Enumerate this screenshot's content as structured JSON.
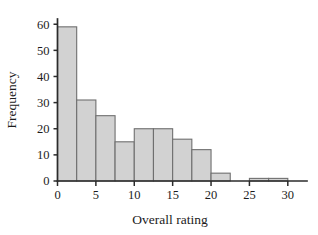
{
  "chart_data": {
    "type": "bar",
    "title": "",
    "xlabel": "Overall rating",
    "ylabel": "Frequency",
    "bin_width": 2.5,
    "bin_edges": [
      0,
      2.5,
      5,
      7.5,
      10,
      12.5,
      15,
      17.5,
      20,
      22.5,
      25,
      27.5,
      30,
      32.5
    ],
    "categories": [
      "0-2.5",
      "2.5-5",
      "5-7.5",
      "7.5-10",
      "10-12.5",
      "12.5-15",
      "15-17.5",
      "17.5-20",
      "20-22.5",
      "22.5-25",
      "25-27.5",
      "27.5-30",
      "30-32.5"
    ],
    "values": [
      59,
      31,
      25,
      15,
      20,
      20,
      16,
      12,
      3,
      0,
      1,
      1,
      0
    ],
    "xlim": [
      0,
      32.5
    ],
    "ylim": [
      0,
      62
    ],
    "xticks": [
      0,
      5,
      10,
      15,
      20,
      25,
      30
    ],
    "xtick_labels": [
      "0",
      "5",
      "10",
      "15",
      "20",
      "25",
      "30"
    ],
    "yticks": [
      0,
      10,
      20,
      30,
      40,
      50,
      60
    ],
    "ytick_labels": [
      "0",
      "10",
      "20",
      "30",
      "40",
      "50",
      "60"
    ],
    "grid": false,
    "legend": false,
    "bar_fill_color": "#d2d2d2",
    "bar_edge_color": "#6f6f6f",
    "axis_color": "#2b2b2b"
  }
}
